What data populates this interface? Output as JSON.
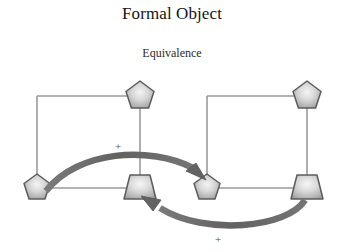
{
  "figure": {
    "title": "Formal Object",
    "subtitle": "Equivalence",
    "background_color": "#ffffff",
    "frame_line_color": "#9a9a9a",
    "node_outline_color": "#5c5c5c",
    "node_fill_center": "#efefef",
    "node_fill_edge": "#9d9d9d",
    "arrow_color": "#6b6b6b"
  },
  "groups": [
    {
      "id": "left-group",
      "name": "left-formal-object",
      "frame": {
        "x": 37,
        "y": 96,
        "width": 103,
        "height": 91
      },
      "nodes": [
        {
          "id": "left-top-pentagon",
          "shape": "pentagon",
          "cx": 140,
          "cy": 96,
          "size": 30
        },
        {
          "id": "left-bottom-pentagon",
          "shape": "pentagon",
          "cx": 37,
          "cy": 188,
          "size": 28
        },
        {
          "id": "left-bottom-trapezoid",
          "shape": "trapezoid",
          "cx": 140,
          "cy": 188,
          "size": 30
        }
      ]
    },
    {
      "id": "right-group",
      "name": "right-formal-object",
      "frame": {
        "x": 207,
        "y": 96,
        "width": 100,
        "height": 91
      },
      "nodes": [
        {
          "id": "right-top-pentagon",
          "shape": "pentagon",
          "cx": 307,
          "cy": 96,
          "size": 30
        },
        {
          "id": "right-bottom-pentagon",
          "shape": "pentagon",
          "cx": 207,
          "cy": 188,
          "size": 28
        },
        {
          "id": "right-bottom-trapezoid",
          "shape": "trapezoid",
          "cx": 307,
          "cy": 188,
          "size": 30
        }
      ]
    }
  ],
  "arrows": [
    {
      "id": "forward-arrow",
      "name": "forward-mapping-arrow",
      "from": "left-bottom-pentagon",
      "to": "right-bottom-pentagon",
      "direction": "left-to-right",
      "curve": "arc-above"
    },
    {
      "id": "reverse-arrow",
      "name": "reverse-mapping-arrow",
      "from": "right-bottom-trapezoid",
      "to": "left-bottom-trapezoid",
      "direction": "right-to-left",
      "curve": "arc-below"
    }
  ],
  "annotations": [
    {
      "id": "plus-upper",
      "text": "+",
      "x": 118,
      "y": 150
    },
    {
      "id": "plus-lower",
      "text": "+",
      "x": 218,
      "y": 243
    }
  ]
}
